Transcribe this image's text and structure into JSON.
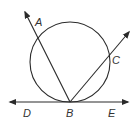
{
  "diagram": {
    "colors": {
      "stroke": "#2a2a2a",
      "label": "#333333",
      "background": "#ffffff"
    },
    "circle": {
      "cx": 70,
      "cy": 62,
      "r": 40
    },
    "tangent_line": {
      "x1": 8,
      "y1": 102,
      "x2": 130,
      "y2": 102
    },
    "rays": [
      {
        "name": "BA",
        "x1": 70,
        "y1": 102,
        "x2": 24,
        "y2": 10
      },
      {
        "name": "BC",
        "x1": 70,
        "y1": 102,
        "x2": 130,
        "y2": 31
      }
    ],
    "labels": {
      "A": "A",
      "B": "B",
      "C": "C",
      "D": "D",
      "E": "E"
    }
  }
}
